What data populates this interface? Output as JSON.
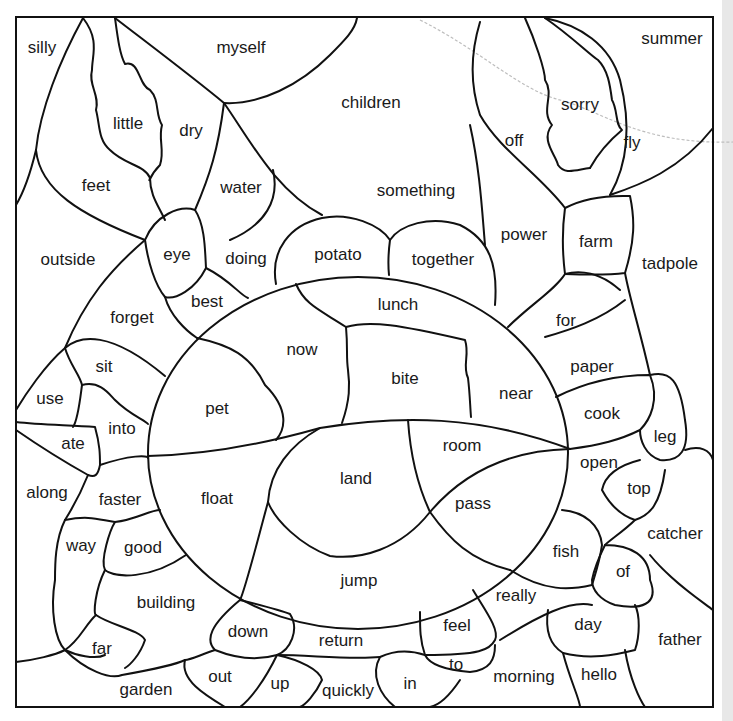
{
  "worksheet": {
    "title": "",
    "frame": {
      "x": 16,
      "y": 17,
      "w": 697,
      "h": 690
    },
    "line_color": "#111111",
    "paper_color": "#ffffff",
    "words": [
      {
        "text": "silly",
        "x": 42,
        "y": 47
      },
      {
        "text": "myself",
        "x": 241,
        "y": 47
      },
      {
        "text": "summer",
        "x": 672,
        "y": 38
      },
      {
        "text": "little",
        "x": 128,
        "y": 123
      },
      {
        "text": "dry",
        "x": 191,
        "y": 130
      },
      {
        "text": "children",
        "x": 371,
        "y": 102
      },
      {
        "text": "sorry",
        "x": 580,
        "y": 104
      },
      {
        "text": "off",
        "x": 514,
        "y": 140
      },
      {
        "text": "fly",
        "x": 632,
        "y": 142
      },
      {
        "text": "feet",
        "x": 96,
        "y": 185
      },
      {
        "text": "water",
        "x": 241,
        "y": 187
      },
      {
        "text": "something",
        "x": 416,
        "y": 190
      },
      {
        "text": "power",
        "x": 524,
        "y": 234
      },
      {
        "text": "farm",
        "x": 596,
        "y": 241
      },
      {
        "text": "outside",
        "x": 68,
        "y": 259
      },
      {
        "text": "eye",
        "x": 177,
        "y": 254
      },
      {
        "text": "doing",
        "x": 246,
        "y": 258
      },
      {
        "text": "potato",
        "x": 338,
        "y": 254
      },
      {
        "text": "together",
        "x": 443,
        "y": 259
      },
      {
        "text": "tadpole",
        "x": 670,
        "y": 263
      },
      {
        "text": "best",
        "x": 207,
        "y": 301
      },
      {
        "text": "lunch",
        "x": 398,
        "y": 304
      },
      {
        "text": "forget",
        "x": 132,
        "y": 317
      },
      {
        "text": "for",
        "x": 566,
        "y": 320
      },
      {
        "text": "now",
        "x": 302,
        "y": 349
      },
      {
        "text": "sit",
        "x": 104,
        "y": 366
      },
      {
        "text": "paper",
        "x": 592,
        "y": 366
      },
      {
        "text": "bite",
        "x": 405,
        "y": 378
      },
      {
        "text": "near",
        "x": 516,
        "y": 393
      },
      {
        "text": "use",
        "x": 50,
        "y": 398
      },
      {
        "text": "pet",
        "x": 217,
        "y": 408
      },
      {
        "text": "cook",
        "x": 602,
        "y": 413
      },
      {
        "text": "into",
        "x": 122,
        "y": 428
      },
      {
        "text": "leg",
        "x": 665,
        "y": 436
      },
      {
        "text": "ate",
        "x": 73,
        "y": 443
      },
      {
        "text": "room",
        "x": 462,
        "y": 445
      },
      {
        "text": "open",
        "x": 599,
        "y": 462
      },
      {
        "text": "land",
        "x": 356,
        "y": 478
      },
      {
        "text": "top",
        "x": 639,
        "y": 488
      },
      {
        "text": "along",
        "x": 47,
        "y": 492
      },
      {
        "text": "faster",
        "x": 120,
        "y": 499
      },
      {
        "text": "float",
        "x": 217,
        "y": 498
      },
      {
        "text": "pass",
        "x": 473,
        "y": 503
      },
      {
        "text": "catcher",
        "x": 675,
        "y": 533
      },
      {
        "text": "way",
        "x": 81,
        "y": 545
      },
      {
        "text": "good",
        "x": 143,
        "y": 547
      },
      {
        "text": "fish",
        "x": 566,
        "y": 551
      },
      {
        "text": "of",
        "x": 623,
        "y": 571
      },
      {
        "text": "jump",
        "x": 359,
        "y": 580
      },
      {
        "text": "really",
        "x": 516,
        "y": 595
      },
      {
        "text": "building",
        "x": 166,
        "y": 602
      },
      {
        "text": "day",
        "x": 588,
        "y": 624
      },
      {
        "text": "down",
        "x": 248,
        "y": 631
      },
      {
        "text": "return",
        "x": 341,
        "y": 640
      },
      {
        "text": "feel",
        "x": 457,
        "y": 625
      },
      {
        "text": "father",
        "x": 680,
        "y": 639
      },
      {
        "text": "far",
        "x": 102,
        "y": 648
      },
      {
        "text": "to",
        "x": 456,
        "y": 664
      },
      {
        "text": "out",
        "x": 220,
        "y": 676
      },
      {
        "text": "up",
        "x": 280,
        "y": 683
      },
      {
        "text": "morning",
        "x": 524,
        "y": 676
      },
      {
        "text": "hello",
        "x": 599,
        "y": 674
      },
      {
        "text": "in",
        "x": 410,
        "y": 683
      },
      {
        "text": "garden",
        "x": 146,
        "y": 689
      },
      {
        "text": "quickly",
        "x": 348,
        "y": 690
      }
    ]
  }
}
